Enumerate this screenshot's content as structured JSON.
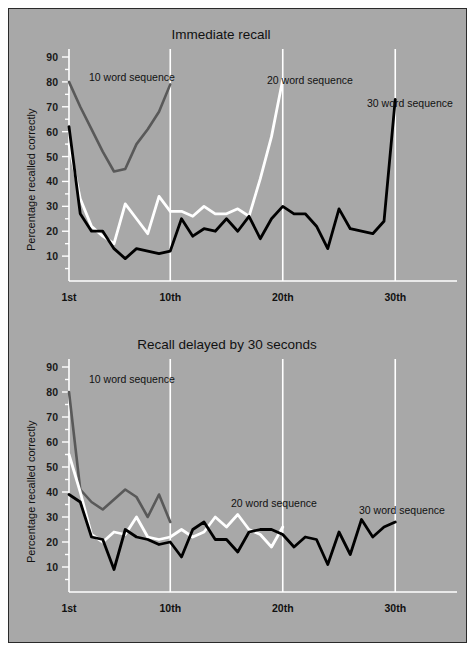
{
  "figure": {
    "background_color": "#a8a8a8",
    "border_color": "#2a2a2a"
  },
  "series_colors": {
    "ten_word": "#595959",
    "twenty_word": "#ffffff",
    "thirty_word": "#000000"
  },
  "panels": [
    {
      "id": "immediate-recall",
      "title": "Immediate recall",
      "ylabel": "Percentage recalled correctly",
      "yticks": [
        10,
        20,
        30,
        40,
        50,
        60,
        70,
        80,
        90
      ],
      "xticks": [
        {
          "value": 1,
          "label": "1st"
        },
        {
          "value": 10,
          "label": "10th"
        },
        {
          "value": 20,
          "label": "20th"
        },
        {
          "value": 30,
          "label": "30th"
        }
      ],
      "series_labels": [
        {
          "name": "ten-word-sequence-label",
          "text": "10 word sequence"
        },
        {
          "name": "twenty-word-sequence-label",
          "text": "20 word sequence"
        },
        {
          "name": "thirty-word-sequence-label",
          "text": "30 word sequence"
        }
      ]
    },
    {
      "id": "delayed-recall",
      "title": "Recall delayed by 30 seconds",
      "ylabel": "Percentage recalled correctly",
      "yticks": [
        10,
        20,
        30,
        40,
        50,
        60,
        70,
        80,
        90
      ],
      "xticks": [
        {
          "value": 1,
          "label": "1st"
        },
        {
          "value": 10,
          "label": "10th"
        },
        {
          "value": 20,
          "label": "20th"
        },
        {
          "value": 30,
          "label": "30th"
        }
      ],
      "series_labels": [
        {
          "name": "ten-word-sequence-label",
          "text": "10 word sequence"
        },
        {
          "name": "twenty-word-sequence-label",
          "text": "20 word sequence"
        },
        {
          "name": "thirty-word-sequence-label",
          "text": "30 word sequence"
        }
      ]
    }
  ],
  "chart_data": [
    {
      "type": "line",
      "title": "Immediate recall",
      "xlabel": "",
      "ylabel": "Percentage recalled correctly",
      "xlim": [
        1,
        33
      ],
      "ylim": [
        0,
        92
      ],
      "grid": true,
      "grid_axis": "x",
      "legend": "inline-annotations",
      "xticks": [
        1,
        10,
        20,
        30
      ],
      "xticklabels": [
        "1st",
        "10th",
        "20th",
        "30th"
      ],
      "yticks": [
        10,
        20,
        30,
        40,
        50,
        60,
        70,
        80,
        90
      ],
      "series": [
        {
          "name": "10 word sequence",
          "color": "#595959",
          "x": [
            1,
            2,
            3,
            4,
            5,
            6,
            7,
            8,
            9,
            10
          ],
          "values": [
            80,
            70,
            61,
            52,
            44,
            45,
            55,
            61,
            68,
            79
          ]
        },
        {
          "name": "20 word sequence",
          "color": "#ffffff",
          "x": [
            1,
            2,
            3,
            4,
            5,
            6,
            7,
            8,
            9,
            10,
            11,
            12,
            13,
            14,
            15,
            16,
            17,
            18,
            19,
            20
          ],
          "values": [
            55,
            33,
            22,
            18,
            15,
            31,
            25,
            19,
            34,
            28,
            28,
            26,
            30,
            27,
            27,
            29,
            26,
            41,
            58,
            81
          ]
        },
        {
          "name": "30 word sequence",
          "color": "#000000",
          "x": [
            1,
            2,
            3,
            4,
            5,
            6,
            7,
            8,
            9,
            10,
            11,
            12,
            13,
            14,
            15,
            16,
            17,
            18,
            19,
            20,
            21,
            22,
            23,
            24,
            25,
            26,
            27,
            28,
            29,
            30
          ],
          "values": [
            62,
            27,
            20,
            20,
            13,
            9,
            13,
            12,
            11,
            12,
            25,
            18,
            21,
            20,
            25,
            20,
            26,
            17,
            25,
            30,
            27,
            27,
            22,
            13,
            29,
            21,
            20,
            19,
            24,
            73
          ]
        }
      ]
    },
    {
      "type": "line",
      "title": "Recall delayed by 30 seconds",
      "xlabel": "",
      "ylabel": "Percentage recalled correctly",
      "xlim": [
        1,
        33
      ],
      "ylim": [
        0,
        92
      ],
      "grid": true,
      "grid_axis": "x",
      "legend": "inline-annotations",
      "xticks": [
        1,
        10,
        20,
        30
      ],
      "xticklabels": [
        "1st",
        "10th",
        "20th",
        "30th"
      ],
      "yticks": [
        10,
        20,
        30,
        40,
        50,
        60,
        70,
        80,
        90
      ],
      "series": [
        {
          "name": "10 word sequence",
          "color": "#595959",
          "x": [
            1,
            2,
            3,
            4,
            5,
            6,
            7,
            8,
            9,
            10
          ],
          "values": [
            80,
            41,
            36,
            33,
            37,
            41,
            38,
            30,
            39,
            28
          ]
        },
        {
          "name": "20 word sequence",
          "color": "#ffffff",
          "x": [
            1,
            2,
            3,
            4,
            5,
            6,
            7,
            8,
            9,
            10,
            11,
            12,
            13,
            14,
            15,
            16,
            17,
            18,
            19,
            20
          ],
          "values": [
            55,
            40,
            23,
            20,
            24,
            23,
            30,
            22,
            21,
            22,
            25,
            22,
            24,
            30,
            26,
            31,
            25,
            23,
            18,
            26
          ]
        },
        {
          "name": "30 word sequence",
          "color": "#000000",
          "x": [
            1,
            2,
            3,
            4,
            5,
            6,
            7,
            8,
            9,
            10,
            11,
            12,
            13,
            14,
            15,
            16,
            17,
            18,
            19,
            20,
            21,
            22,
            23,
            24,
            25,
            26,
            27,
            28,
            29,
            30
          ],
          "values": [
            39,
            36,
            22,
            21,
            9,
            25,
            22,
            21,
            19,
            20,
            14,
            25,
            28,
            21,
            21,
            16,
            24,
            25,
            25,
            23,
            18,
            22,
            21,
            11,
            24,
            15,
            29,
            22,
            26,
            28
          ]
        }
      ]
    }
  ]
}
